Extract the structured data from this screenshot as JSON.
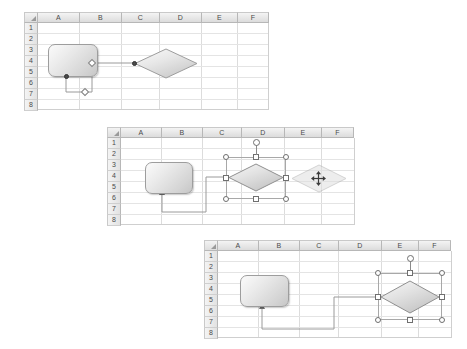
{
  "app": {
    "context": "spreadsheet-flowchart-connector-reroute",
    "background_color": "#ffffff"
  },
  "grid": {
    "columns": [
      "A",
      "B",
      "C",
      "D",
      "E",
      "F"
    ],
    "rows": [
      "1",
      "2",
      "3",
      "4",
      "5",
      "6",
      "7",
      "8"
    ],
    "corner_icon": "select-all-triangle-icon",
    "header_fill": "#eaeaea",
    "header_text_color": "#4a4a4a",
    "gridline_color": "#dcdcdc",
    "cell_fill": "#ffffff"
  },
  "palette": {
    "shape_outline": "#9d9d9d",
    "shape_fill_light": "#fbfbfb",
    "shape_fill_dark": "#c6c6c6",
    "connector_line": "#9a9a9a",
    "endpoint_fill": "#4a4a4a",
    "midpoint_fill": "#ffffff",
    "handle_fill": "#ffffff",
    "handle_outline": "#6f6f6f",
    "selection_frame": "#a8a8a8"
  },
  "panels": [
    {
      "id": "panel-1",
      "caption": "",
      "state": "connector-routed-below-process",
      "shapes": [
        {
          "name": "process-rounded-rectangle",
          "type": "rounded-rectangle",
          "selected": false,
          "anchor_cells": "A3:B5"
        },
        {
          "name": "decision-diamond",
          "type": "diamond",
          "selected": false,
          "anchor_cells": "C3:D5"
        }
      ],
      "connector": {
        "name": "elbow-connector",
        "type": "elbow",
        "start_point": "process-bottom",
        "end_point": "diamond-left",
        "endpoint_markers": 2,
        "midpoint_handles": 2
      }
    },
    {
      "id": "panel-2",
      "caption": "",
      "state": "diamond-selected-and-being-dragged-right",
      "shapes": [
        {
          "name": "process-rounded-rectangle",
          "type": "rounded-rectangle",
          "selected": false,
          "anchor_cells": "A3:B5"
        },
        {
          "name": "decision-diamond",
          "type": "diamond",
          "selected": true,
          "anchor_cells": "C2:D5",
          "handles": {
            "corner_circles": 4,
            "edge_squares": 4,
            "rotation_handle": true
          }
        },
        {
          "name": "decision-diamond-drag-ghost",
          "type": "diamond-ghost",
          "selected": false,
          "cursor": "move-cursor",
          "anchor_cells": "E3:F5"
        }
      ],
      "connector": {
        "name": "elbow-connector",
        "type": "elbow",
        "start_point": "process-bottom",
        "end_point": "diamond-left",
        "endpoint_markers": 0,
        "midpoint_handles": 0
      }
    },
    {
      "id": "panel-3",
      "caption": "",
      "state": "connector-reattached-after-drop",
      "shapes": [
        {
          "name": "process-rounded-rectangle",
          "type": "rounded-rectangle",
          "selected": false,
          "anchor_cells": "A3:B5"
        },
        {
          "name": "decision-diamond",
          "type": "diamond",
          "selected": true,
          "anchor_cells": "E2:F6",
          "handles": {
            "corner_circles": 4,
            "edge_squares": 4,
            "rotation_handle": true
          }
        }
      ],
      "connector": {
        "name": "elbow-connector",
        "type": "elbow",
        "start_point": "process-bottom",
        "end_point": "diamond-left",
        "endpoint_markers": 0,
        "midpoint_handles": 0
      }
    }
  ]
}
